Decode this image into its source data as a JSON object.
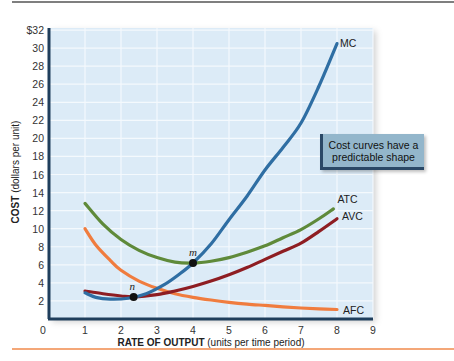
{
  "chart_data": {
    "type": "line",
    "title": "",
    "xlabel": "RATE OF OUTPUT",
    "xlabel_suffix": "(units per time period)",
    "ylabel": "COST",
    "ylabel_suffix": "(dollars per unit)",
    "xlim": [
      0,
      9
    ],
    "ylim": [
      0,
      32
    ],
    "grid": true,
    "x_ticks": [
      "0",
      "1",
      "2",
      "3",
      "4",
      "5",
      "6",
      "7",
      "8",
      "9"
    ],
    "y_ticks": [
      "2",
      "4",
      "6",
      "8",
      "10",
      "12",
      "14",
      "16",
      "18",
      "20",
      "22",
      "24",
      "26",
      "28",
      "30",
      "$32"
    ],
    "series": [
      {
        "name": "MC",
        "color": "#2f6ea3",
        "x": [
          1,
          1.3,
          1.7,
          2.2,
          2.7,
          3.2,
          3.6,
          4,
          4.5,
          5,
          5.5,
          6,
          6.5,
          7,
          7.5,
          8
        ],
        "y": [
          2.9,
          2.4,
          2.2,
          2.3,
          2.8,
          3.8,
          4.9,
          6.2,
          8.3,
          11,
          13.6,
          16.5,
          19,
          21.7,
          25.8,
          30.5
        ]
      },
      {
        "name": "ATC",
        "color": "#5f8a3a",
        "x": [
          1,
          1.5,
          2,
          2.5,
          3,
          3.5,
          4,
          4.5,
          5,
          5.5,
          6,
          6.5,
          7,
          7.5,
          7.9
        ],
        "y": [
          12.8,
          10.5,
          8.8,
          7.6,
          6.8,
          6.3,
          6.2,
          6.4,
          6.8,
          7.4,
          8.1,
          9,
          9.9,
          11.1,
          12.2
        ]
      },
      {
        "name": "AVC",
        "color": "#8e1d22",
        "x": [
          1,
          1.5,
          2,
          2.35,
          3,
          3.5,
          4,
          4.5,
          5,
          5.5,
          6,
          6.5,
          7,
          7.5,
          8
        ],
        "y": [
          3.1,
          2.8,
          2.55,
          2.45,
          2.7,
          3.1,
          3.6,
          4.2,
          4.9,
          5.7,
          6.6,
          7.5,
          8.4,
          9.7,
          11.1
        ]
      },
      {
        "name": "AFC",
        "color": "#f07c3e",
        "x": [
          1,
          1.3,
          1.7,
          2,
          2.5,
          3,
          3.5,
          4,
          4.5,
          5,
          5.5,
          6,
          6.5,
          7,
          7.5,
          8
        ],
        "y": [
          10,
          8.2,
          6.5,
          5.4,
          4.2,
          3.4,
          2.8,
          2.4,
          2.1,
          1.85,
          1.65,
          1.5,
          1.35,
          1.22,
          1.12,
          1.05
        ]
      }
    ],
    "points": [
      {
        "label": "m",
        "x": 4,
        "y": 6.2
      },
      {
        "label": "n",
        "x": 2.35,
        "y": 2.45
      }
    ],
    "annotations": [
      {
        "text": "Cost curves have a predictable shape",
        "position": "right-middle"
      }
    ]
  },
  "note": {
    "text": "Cost curves have a predictable shape"
  },
  "colors": {
    "plot_bg": "#dcebf7",
    "grid": "#f4f9fd",
    "axis": "#1f3e5c",
    "rule_top": "#555555",
    "rule_bottom": "#f08a4b"
  }
}
